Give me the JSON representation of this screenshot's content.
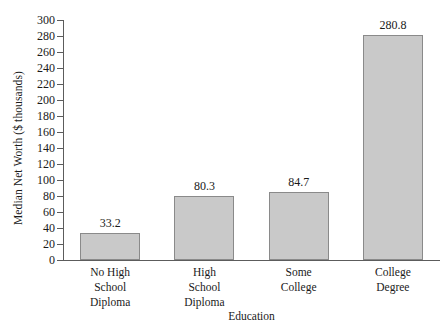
{
  "chart_data": {
    "type": "bar",
    "title": "",
    "xlabel": "Education",
    "ylabel": "Median Net Worth ($ thousands)",
    "categories": [
      "No High School Diploma",
      "High School Diploma",
      "Some College",
      "College Degree"
    ],
    "category_lines": [
      [
        "No High",
        "School",
        "Diploma"
      ],
      [
        "High",
        "School",
        "Diploma"
      ],
      [
        "Some",
        "College"
      ],
      [
        "College",
        "Degree"
      ]
    ],
    "values": [
      33.2,
      80.3,
      84.7,
      280.8
    ],
    "value_labels": [
      "33.2",
      "80.3",
      "84.7",
      "280.8"
    ],
    "ylim": [
      0,
      300
    ],
    "ytick_step": 20,
    "yticks": [
      0,
      20,
      40,
      60,
      80,
      100,
      120,
      140,
      160,
      180,
      200,
      220,
      240,
      260,
      280,
      300
    ],
    "ytick_labels": [
      "0",
      "20",
      "40",
      "60",
      "80",
      "100",
      "120",
      "140",
      "160",
      "180",
      "200",
      "220",
      "240",
      "260",
      "280",
      "300"
    ],
    "grid": false,
    "legend": false,
    "legend_position": "none",
    "bar_fill_color": "#c9c9c9",
    "bar_edge_color": "#8a8a8a",
    "axis_color": "#5c5c5c",
    "text_color": "#1a1a1a",
    "background_color": "#ffffff"
  }
}
